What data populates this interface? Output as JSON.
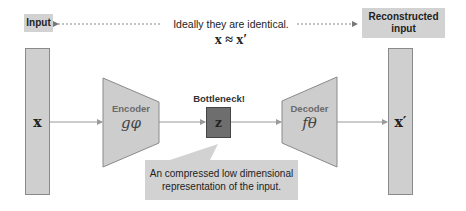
{
  "labels": {
    "input": "Input",
    "reconstructed": "Reconstructed input",
    "ideally": "Ideally they are identical.",
    "equation": "x ≈ x′",
    "bottleneck": "Bottleneck!"
  },
  "nodes": {
    "input_vector": "x",
    "encoder_title": "Encoder",
    "encoder_fn": "gφ",
    "latent": "z",
    "decoder_title": "Decoder",
    "decoder_fn": "fθ",
    "output_vector": "x′"
  },
  "callout": {
    "line1": "An compressed low dimensional",
    "line2": "representation of the input."
  },
  "colors": {
    "box_fill": "#d2d2d2",
    "shape_fill": "#cdcdcd",
    "latent_fill": "#6e6e6e",
    "stroke": "#8a8a8a",
    "arrow": "#9a9a9a"
  }
}
